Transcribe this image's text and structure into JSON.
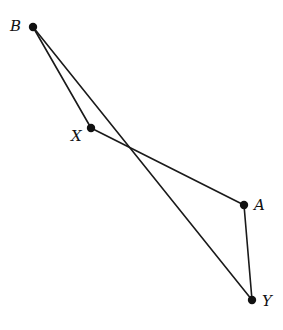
{
  "diagram": {
    "type": "geometry",
    "points": [
      {
        "id": "B",
        "label": "B",
        "x": 33,
        "y": 27,
        "lx": 10,
        "ly": 31
      },
      {
        "id": "X",
        "label": "X",
        "x": 91,
        "y": 128,
        "lx": 71,
        "ly": 141
      },
      {
        "id": "A",
        "label": "A",
        "x": 244,
        "y": 205,
        "lx": 254,
        "ly": 210
      },
      {
        "id": "Y",
        "label": "Y",
        "x": 252,
        "y": 300,
        "lx": 262,
        "ly": 306
      }
    ],
    "segments": [
      {
        "from": "B",
        "to": "X"
      },
      {
        "from": "X",
        "to": "A"
      },
      {
        "from": "A",
        "to": "Y"
      },
      {
        "from": "B",
        "to": "Y"
      }
    ],
    "colors": {
      "stroke": "#1a1a1a",
      "point": "#111111",
      "background": "#ffffff"
    }
  }
}
